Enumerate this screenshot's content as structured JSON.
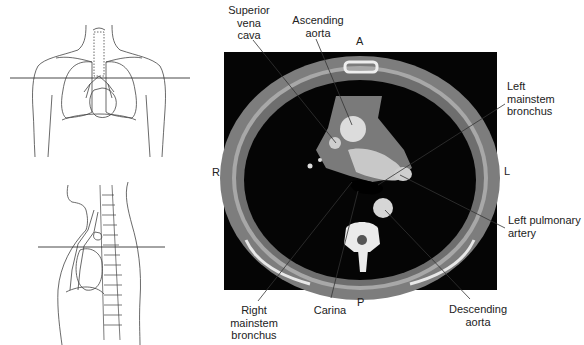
{
  "figure": {
    "orientation": {
      "anterior": "A",
      "posterior": "P",
      "right": "R",
      "left": "L"
    },
    "colors": {
      "background": "#ffffff",
      "ct_air": "#050505",
      "ct_soft_tissue": "#8a8a8a",
      "ct_vessel": "#d8d8d8",
      "ct_bone": "#efefef",
      "leader_line": "#333333"
    },
    "labels": {
      "superior_vena_cava": [
        "Superior",
        "vena",
        "cava"
      ],
      "ascending_aorta": [
        "Ascending",
        "aorta"
      ],
      "left_mainstem_bronchus": [
        "Left",
        "mainstem",
        "bronchus"
      ],
      "left_pulmonary_artery": [
        "Left pulmonary",
        "artery"
      ],
      "descending_aorta": [
        "Descending",
        "aorta"
      ],
      "carina": [
        "Carina"
      ],
      "right_mainstem_bronchus": [
        "Right",
        "mainstem",
        "bronchus"
      ]
    },
    "scout_views": {
      "coronal": "Anterior thorax outline with horizontal slice line",
      "sagittal": "Lateral thorax outline with horizontal slice line"
    }
  }
}
